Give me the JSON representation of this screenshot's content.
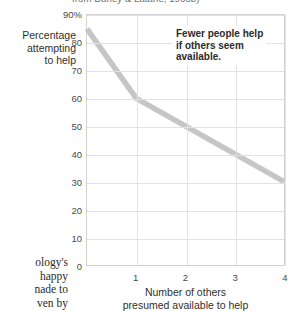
{
  "caption": {
    "top_partial": "from Darley & Latané, 1968b)"
  },
  "body_text": {
    "lines": [
      "ology's",
      "happy",
      "nade to",
      "ven by"
    ]
  },
  "annotation": {
    "lines": [
      "Fewer people help",
      "if others seem",
      "available."
    ]
  },
  "axis": {
    "y_title_lines": [
      "Percentage",
      "attempting",
      "to help"
    ],
    "x_title_lines": [
      "Number of others",
      "presumed available to help"
    ]
  },
  "colors": {
    "line": "#c6c6c6",
    "grid": "#e2e2e2",
    "frame": "#d2d2d2",
    "text": "#2f2f2f"
  },
  "chart_data": {
    "type": "line",
    "title": "",
    "xlabel": "Number of others presumed available to help",
    "ylabel": "Percentage attempting to help",
    "x": [
      0,
      1,
      2,
      3,
      4
    ],
    "values": [
      85,
      60,
      50,
      40,
      30
    ],
    "series": [
      {
        "name": "Percentage attempting to help",
        "values": [
          85,
          60,
          50,
          40,
          30
        ]
      }
    ],
    "xlim": [
      0,
      4
    ],
    "ylim": [
      0,
      90
    ],
    "xticks": [
      "1",
      "2",
      "3",
      "4"
    ],
    "xtick_values": [
      1,
      2,
      3,
      4
    ],
    "yticks": [
      "0",
      "10",
      "20",
      "30",
      "40",
      "50",
      "60",
      "70",
      "80",
      "90%"
    ],
    "ytick_values": [
      0,
      10,
      20,
      30,
      40,
      50,
      60,
      70,
      80,
      90
    ],
    "grid": true,
    "legend": "none",
    "annotations": [
      "Fewer people help if others seem available."
    ]
  }
}
